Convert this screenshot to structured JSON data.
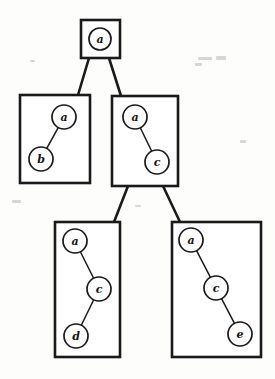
{
  "diagram": {
    "background_color": "#fdfdfc",
    "ink_color": "#1a1a1a",
    "node_fill": "#ffffff",
    "canvas": {
      "width": 275,
      "height": 379
    },
    "boxes": [
      {
        "id": "box-root",
        "name": "root-graph-box",
        "x": 81,
        "y": 20,
        "width": 39,
        "height": 38,
        "nodes": [
          {
            "id": "root-a",
            "label": "a",
            "cx": 100,
            "cy": 39,
            "r": 11
          }
        ],
        "edges": []
      },
      {
        "id": "box-left",
        "name": "left-graph-box",
        "x": 20,
        "y": 95,
        "width": 70,
        "height": 88,
        "nodes": [
          {
            "id": "left-a",
            "label": "a",
            "cx": 64,
            "cy": 117,
            "r": 12
          },
          {
            "id": "left-b",
            "label": "b",
            "cx": 41,
            "cy": 159,
            "r": 12
          }
        ],
        "edges": [
          {
            "from": "left-a",
            "to": "left-b"
          }
        ]
      },
      {
        "id": "box-right",
        "name": "right-graph-box",
        "x": 112,
        "y": 96,
        "width": 66,
        "height": 90,
        "nodes": [
          {
            "id": "right-a",
            "label": "a",
            "cx": 135,
            "cy": 117,
            "r": 12
          },
          {
            "id": "right-c",
            "label": "c",
            "cx": 157,
            "cy": 162,
            "r": 12
          }
        ],
        "edges": [
          {
            "from": "right-a",
            "to": "right-c"
          }
        ]
      },
      {
        "id": "box-bottom-left",
        "name": "bottom-left-graph-box",
        "x": 55,
        "y": 222,
        "width": 65,
        "height": 135,
        "nodes": [
          {
            "id": "bl-a",
            "label": "a",
            "cx": 75,
            "cy": 241,
            "r": 12
          },
          {
            "id": "bl-c",
            "label": "c",
            "cx": 99,
            "cy": 289,
            "r": 12
          },
          {
            "id": "bl-d",
            "label": "d",
            "cx": 76,
            "cy": 336,
            "r": 12
          }
        ],
        "edges": [
          {
            "from": "bl-a",
            "to": "bl-c"
          },
          {
            "from": "bl-c",
            "to": "bl-d"
          }
        ]
      },
      {
        "id": "box-bottom-right",
        "name": "bottom-right-graph-box",
        "x": 172,
        "y": 222,
        "width": 89,
        "height": 135,
        "nodes": [
          {
            "id": "br-a",
            "label": "a",
            "cx": 191,
            "cy": 240,
            "r": 12
          },
          {
            "id": "br-c",
            "label": "c",
            "cx": 216,
            "cy": 288,
            "r": 12
          },
          {
            "id": "br-e",
            "label": "e",
            "cx": 240,
            "cy": 334,
            "r": 12
          }
        ],
        "edges": [
          {
            "from": "br-a",
            "to": "br-c"
          },
          {
            "from": "br-c",
            "to": "br-e"
          }
        ]
      }
    ],
    "tree_links": [
      {
        "id": "link-root-left",
        "name": "tree-link-root-to-left",
        "x1": 89,
        "y1": 58,
        "x2": 78,
        "y2": 95
      },
      {
        "id": "link-root-right",
        "name": "tree-link-root-to-right",
        "x1": 109,
        "y1": 58,
        "x2": 121,
        "y2": 96
      },
      {
        "id": "link-right-bl",
        "name": "tree-link-right-to-bottom-left",
        "x1": 128,
        "y1": 186,
        "x2": 114,
        "y2": 222
      },
      {
        "id": "link-right-br",
        "name": "tree-link-right-to-bottom-right",
        "x1": 163,
        "y1": 186,
        "x2": 180,
        "y2": 222
      }
    ],
    "specks": [
      {
        "x": 198,
        "y": 57,
        "w": 14,
        "h": 3
      },
      {
        "x": 216,
        "y": 56,
        "w": 10,
        "h": 4
      },
      {
        "x": 195,
        "y": 63,
        "w": 7,
        "h": 3
      },
      {
        "x": 12,
        "y": 200,
        "w": 9,
        "h": 3
      },
      {
        "x": 240,
        "y": 140,
        "w": 6,
        "h": 3
      },
      {
        "x": 30,
        "y": 60,
        "w": 5,
        "h": 2
      },
      {
        "x": 135,
        "y": 205,
        "w": 6,
        "h": 2
      },
      {
        "x": 250,
        "y": 300,
        "w": 5,
        "h": 2
      }
    ]
  }
}
